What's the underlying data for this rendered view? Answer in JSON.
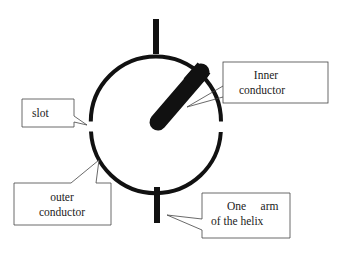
{
  "diagram": {
    "type": "cross-section schematic",
    "colors": {
      "stroke": "#1a1a1a",
      "fill": "#111111",
      "background": "#ffffff",
      "box_border": "#444444",
      "text": "#222222"
    },
    "labels": {
      "inner_conductor": {
        "line1": "Inner",
        "line2": "conductor"
      },
      "slot": {
        "line1": "slot"
      },
      "outer_conductor": {
        "line1": "outer",
        "line2": "conductor"
      },
      "helix_arm": {
        "line1": "One     arm",
        "line2": "of the helix"
      }
    }
  }
}
